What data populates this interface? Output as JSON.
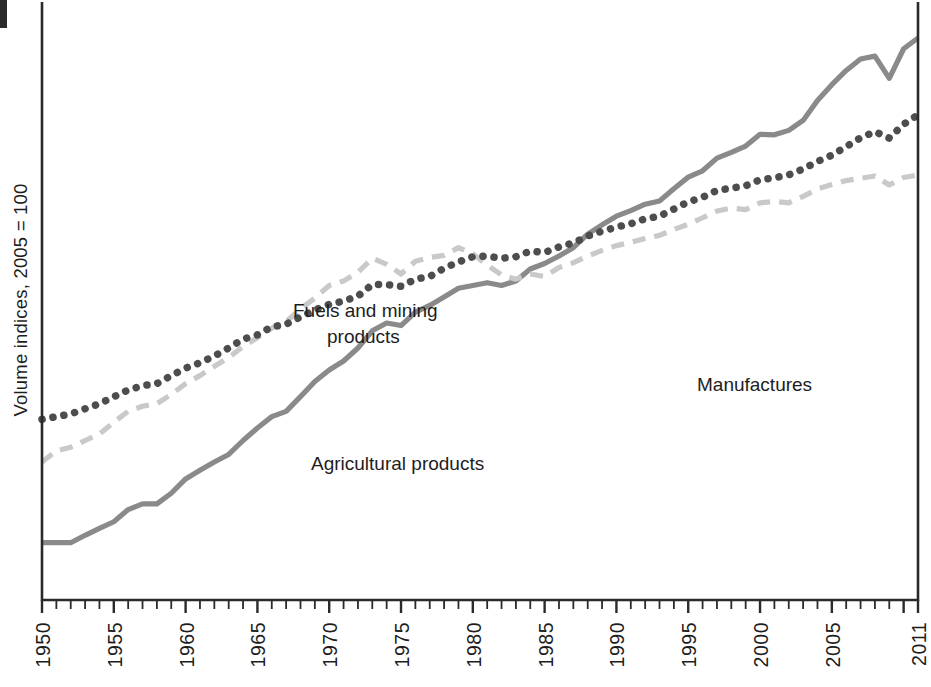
{
  "figure": {
    "y_axis_label": "Volume indices, 2005 = 100",
    "bg_color": "#ffffff",
    "axis_color": "#2a2a2a"
  },
  "series_labels": {
    "fuels_line1": "Fuels and mining",
    "fuels_line2": "products",
    "agricultural": "Agricultural products",
    "manufactures": "Manufactures"
  },
  "axis_ticks": {
    "x_labels": [
      "1950",
      "1955",
      "1960",
      "1965",
      "1970",
      "1975",
      "1980",
      "1985",
      "1990",
      "1995",
      "2000",
      "2005",
      "2011"
    ]
  },
  "chart_data": {
    "type": "line",
    "title": "",
    "subtitle": "",
    "xlabel": "",
    "ylabel": "Volume indices, 2005 = 100",
    "scale": "log",
    "grid": false,
    "legend": "inline-annotations",
    "xlim": [
      1950,
      2011
    ],
    "ylim": [
      1.0,
      135
    ],
    "x": [
      1950,
      1951,
      1952,
      1953,
      1954,
      1955,
      1956,
      1957,
      1958,
      1959,
      1960,
      1961,
      1962,
      1963,
      1964,
      1965,
      1966,
      1967,
      1968,
      1969,
      1970,
      1971,
      1972,
      1973,
      1974,
      1975,
      1976,
      1977,
      1978,
      1979,
      1980,
      1981,
      1982,
      1983,
      1984,
      1985,
      1986,
      1987,
      1988,
      1989,
      1990,
      1991,
      1992,
      1993,
      1994,
      1995,
      1996,
      1997,
      1998,
      1999,
      2000,
      2001,
      2002,
      2003,
      2004,
      2005,
      2006,
      2007,
      2008,
      2009,
      2010,
      2011
    ],
    "series": [
      {
        "name": "Manufactures",
        "color": "#8a8a8a",
        "style": "solid",
        "values": [
          1.6,
          1.6,
          1.6,
          1.7,
          1.8,
          1.9,
          2.1,
          2.2,
          2.2,
          2.4,
          2.7,
          2.9,
          3.1,
          3.3,
          3.7,
          4.1,
          4.5,
          4.7,
          5.3,
          6.0,
          6.6,
          7.1,
          7.9,
          9.1,
          9.7,
          9.5,
          10.6,
          11.2,
          12.0,
          12.9,
          13.2,
          13.5,
          13.2,
          13.7,
          15.1,
          15.8,
          16.8,
          18.0,
          20.1,
          21.7,
          23.3,
          24.4,
          25.7,
          26.4,
          29.2,
          32.1,
          33.8,
          37.5,
          39.3,
          41.4,
          45.6,
          45.4,
          47.1,
          51.1,
          60.2,
          68.5,
          77.0,
          84.6,
          86.6,
          72.2,
          92.0,
          100.5
        ]
      },
      {
        "name": "Fuels and mining products",
        "color": "#c9c9c9",
        "style": "dashed",
        "values": [
          3.1,
          3.4,
          3.5,
          3.7,
          3.9,
          4.3,
          4.7,
          4.9,
          5.0,
          5.4,
          5.9,
          6.3,
          6.8,
          7.3,
          8.0,
          8.6,
          9.3,
          9.8,
          10.9,
          11.9,
          13.2,
          13.7,
          14.7,
          16.5,
          15.7,
          14.5,
          16.1,
          16.6,
          16.9,
          18.0,
          17.1,
          15.6,
          14.4,
          13.9,
          14.5,
          14.2,
          15.3,
          15.9,
          16.8,
          17.6,
          18.3,
          18.8,
          19.4,
          19.9,
          20.9,
          21.8,
          23.0,
          24.3,
          24.9,
          24.6,
          26.0,
          26.3,
          26.0,
          27.4,
          29.1,
          30.2,
          31.2,
          31.8,
          32.4,
          30.1,
          32.0,
          32.7
        ]
      },
      {
        "name": "Agricultural products",
        "color": "#4d4d4d",
        "style": "dotted",
        "values": [
          4.4,
          4.5,
          4.6,
          4.8,
          5.0,
          5.3,
          5.6,
          5.8,
          5.9,
          6.3,
          6.7,
          7.0,
          7.4,
          7.9,
          8.5,
          8.8,
          9.4,
          9.6,
          10.2,
          10.8,
          11.3,
          11.6,
          12.1,
          13.3,
          13.3,
          13.1,
          13.9,
          14.2,
          15.2,
          16.0,
          16.7,
          16.8,
          16.5,
          16.7,
          17.5,
          17.3,
          18.1,
          18.7,
          19.8,
          20.6,
          21.3,
          21.9,
          22.8,
          23.3,
          24.7,
          26.2,
          27.2,
          28.8,
          29.3,
          29.9,
          31.4,
          31.9,
          32.7,
          34.3,
          36.5,
          38.4,
          41.2,
          44.3,
          46.6,
          44.2,
          49.5,
          53.5
        ]
      }
    ]
  }
}
